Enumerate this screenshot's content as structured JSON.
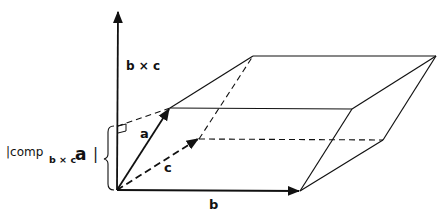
{
  "figure": {
    "type": "parallelepiped-volume-diagram",
    "labels": {
      "axis": "b × c",
      "vector_a": "a",
      "vector_b": "b",
      "vector_c": "c",
      "component_prefix": "|comp",
      "component_subscript": "b × c",
      "component_vector": "a",
      "component_suffix": "|"
    },
    "colors": {
      "ink": "#111111",
      "background": "#ffffff"
    }
  }
}
